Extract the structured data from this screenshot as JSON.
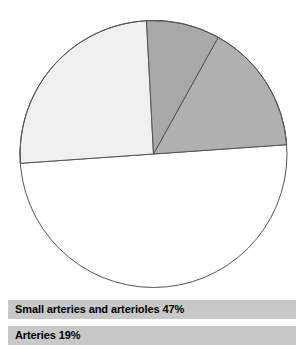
{
  "chart_data": {
    "type": "pie",
    "title": "",
    "subtitle": "",
    "xlabel": "",
    "ylabel": "",
    "legend_position": "bottom",
    "grid": false,
    "units": "percent",
    "categories": [
      "Small arteries and arterioles",
      "Arteries",
      "Capillaries",
      "Veins and venules"
    ],
    "values": [
      47,
      19,
      25,
      9
    ],
    "slices": [
      {
        "label": "Small arteries and arterioles",
        "value": 47,
        "value_text": "47%",
        "color": "#cdcdcd",
        "start_angle": 176,
        "end_angle": 356,
        "has_legend_bar": true
      },
      {
        "label": "Arteries",
        "value": 19,
        "value_text": "19%",
        "color": "#b0b0b0",
        "start_angle": 299,
        "end_angle": 356,
        "has_legend_bar": true
      },
      {
        "label": "Capillaries",
        "value": 25,
        "value_text": "",
        "color": "#f0f0f0",
        "start_angle": 176,
        "end_angle": 267,
        "has_legend_bar": false
      },
      {
        "label": "Veins and venules",
        "value": 9,
        "value_text": "",
        "color": "#a8a8a8",
        "start_angle": 267,
        "end_angle": 299,
        "has_legend_bar": false
      }
    ],
    "geometry": {
      "center_x": 153.5,
      "center_y": 154,
      "radius": 133.5,
      "stroke_color": "#555555",
      "stroke_width": 1
    }
  },
  "legend": {
    "bar_color": "#c8c8c8",
    "items": [
      {
        "text": "Small arteries and arterioles 47%"
      },
      {
        "text": "Arteries 19%"
      }
    ]
  }
}
